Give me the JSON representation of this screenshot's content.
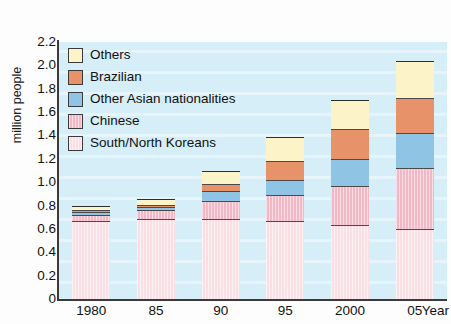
{
  "chart_data": {
    "type": "bar",
    "subtype": "stacked-bar",
    "title": "",
    "xlabel": "Year",
    "ylabel": "million people",
    "ylim": [
      0,
      2.2
    ],
    "ytick_values": [
      2.2,
      2.0,
      1.8,
      1.6,
      1.4,
      1.2,
      1.0,
      0.8,
      0.6,
      0.4,
      0.2,
      0
    ],
    "ytick_labels": [
      "2.2",
      "2.0",
      "1.8",
      "1.6",
      "1.4",
      "1.2",
      "1.0",
      "0.8",
      "0.6",
      "0.4",
      "0.2",
      "0"
    ],
    "categories": [
      "1980",
      "85",
      "90",
      "95",
      "2000",
      "05"
    ],
    "grid": false,
    "legend_position": "upper-left-inside",
    "stack_order_bottom_to_top": [
      "South/North Koreans",
      "Chinese",
      "Other Asian nationalities",
      "Brazilian",
      "Others"
    ],
    "series": [
      {
        "name": "South/North Koreans",
        "color": "#fadfe4",
        "values": [
          0.665,
          0.684,
          0.688,
          0.667,
          0.635,
          0.599
        ]
      },
      {
        "name": "Chinese",
        "color": "#f2b8c6",
        "values": [
          0.053,
          0.075,
          0.15,
          0.223,
          0.336,
          0.52
        ]
      },
      {
        "name": "Other Asian nationalities",
        "color": "#8fc4e4",
        "values": [
          0.025,
          0.03,
          0.09,
          0.13,
          0.23,
          0.3
        ]
      },
      {
        "name": "Brazilian",
        "color": "#e8926a",
        "values": [
          0.015,
          0.02,
          0.06,
          0.16,
          0.255,
          0.302
        ]
      },
      {
        "name": "Others",
        "color": "#fcf3c9",
        "values": [
          0.037,
          0.051,
          0.105,
          0.205,
          0.245,
          0.315
        ]
      }
    ],
    "totals": [
      0.795,
      0.86,
      1.093,
      1.385,
      1.701,
      2.036
    ],
    "plot_background_color": "#d6eef7",
    "axis_color": "#2e2e2e"
  },
  "legend": {
    "items": [
      {
        "label": "Others",
        "color": "#fcf3c9",
        "hatched": false
      },
      {
        "label": "Brazilian",
        "color": "#e8926a",
        "hatched": false
      },
      {
        "label": "Other Asian nationalities",
        "color": "#8fc4e4",
        "hatched": false
      },
      {
        "label": "Chinese",
        "color": "#f2b8c6",
        "hatched": true
      },
      {
        "label": "South/North Koreans",
        "color": "#fadfe4",
        "hatched": true
      }
    ]
  },
  "axes": {
    "y_title": "million people",
    "x_unit_label": "Year"
  }
}
